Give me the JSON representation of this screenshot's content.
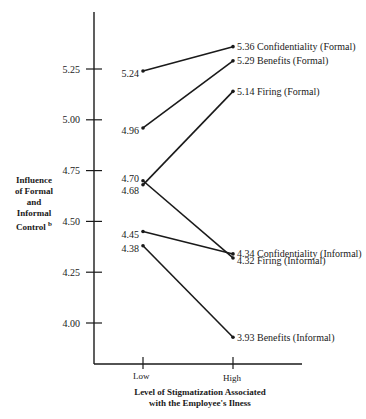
{
  "chart_data": {
    "type": "line",
    "title": "",
    "xlabel": "Level of Stigmatization Associated with the Employee's Ilness",
    "xlabel_line1": "Level of Stigmatization Associated",
    "xlabel_line2": "with the Employee's Ilness",
    "ylabel": "Influence of Formal and Informal Control",
    "ylabel_lines": [
      "Influence",
      "of Formal",
      "and",
      "Informal",
      "Control"
    ],
    "ylabel_superscript": "b",
    "categories": [
      "Low",
      "High"
    ],
    "y_ticks": [
      4.0,
      4.25,
      4.5,
      4.75,
      5.0,
      5.25
    ],
    "y_tick_labels": [
      "4.00",
      "4.25",
      "4.50",
      "4.75",
      "5.00",
      "5.25"
    ],
    "ylim": [
      3.8,
      5.45
    ],
    "grid": false,
    "legend_position": "inline-right",
    "series": [
      {
        "name": "Confidentiality (Formal)",
        "values": [
          5.24,
          5.36
        ],
        "labels": [
          "5.24",
          "5.36"
        ]
      },
      {
        "name": "Benefits (Formal)",
        "values": [
          4.96,
          5.29
        ],
        "labels": [
          "4.96",
          "5.29"
        ]
      },
      {
        "name": "Firing (Formal)",
        "values": [
          4.68,
          5.14
        ],
        "labels": [
          "4.68",
          "5.14"
        ]
      },
      {
        "name": "Confidentiality (Informal)",
        "values": [
          4.45,
          4.34
        ],
        "labels": [
          "4.45",
          "4.34"
        ]
      },
      {
        "name": "Firing (Informal)",
        "values": [
          4.7,
          4.32
        ],
        "labels": [
          "4.70",
          "4.32"
        ]
      },
      {
        "name": "Benefits (Informal)",
        "values": [
          4.38,
          3.93
        ],
        "labels": [
          "4.38",
          "3.93"
        ]
      }
    ]
  },
  "colors": {
    "ink": "#1a1a1a",
    "background": "#ffffff"
  }
}
